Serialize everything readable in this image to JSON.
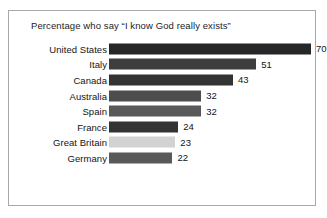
{
  "chart_data": {
    "type": "bar",
    "orientation": "horizontal",
    "title": "Percentage who say “I know God really exists”",
    "xlabel": "",
    "ylabel": "",
    "xlim": [
      0,
      70
    ],
    "grid": false,
    "legend": false,
    "value_suffix": "",
    "categories": [
      "United States",
      "Italy",
      "Canada",
      "Australia",
      "Spain",
      "France",
      "Great Britain",
      "Germany"
    ],
    "values": [
      70,
      51,
      43,
      32,
      32,
      24,
      23,
      22
    ],
    "bar_colors": [
      "#262629",
      "#3d3d3d",
      "#333333",
      "#4d4d4d",
      "#595959",
      "#333333",
      "#d2d2d2",
      "#595959"
    ],
    "bars": [
      {
        "label": "United States",
        "value": 70,
        "value_label": "70",
        "color": "#262629"
      },
      {
        "label": "Italy",
        "value": 51,
        "value_label": "51",
        "color": "#3d3d3d"
      },
      {
        "label": "Canada",
        "value": 43,
        "value_label": "43",
        "color": "#333333"
      },
      {
        "label": "Australia",
        "value": 32,
        "value_label": "32",
        "color": "#4d4d4d"
      },
      {
        "label": "Spain",
        "value": 32,
        "value_label": "32",
        "color": "#595959"
      },
      {
        "label": "France",
        "value": 24,
        "value_label": "24",
        "color": "#333333"
      },
      {
        "label": "Great Britain",
        "value": 23,
        "value_label": "23",
        "color": "#d2d2d2"
      },
      {
        "label": "Germany",
        "value": 22,
        "value_label": "22",
        "color": "#595959"
      }
    ]
  },
  "frame": {
    "border_color": "#a8a8a8",
    "background": "#ffffff"
  }
}
